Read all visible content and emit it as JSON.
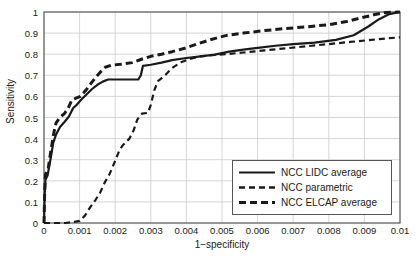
{
  "chart_data": {
    "type": "line",
    "title": "",
    "xlabel": "1−specificity",
    "ylabel": "Sensitivity",
    "xlim": [
      0,
      0.01
    ],
    "ylim": [
      0,
      1
    ],
    "xticks": [
      "0",
      "0.001",
      "0.002",
      "0.003",
      "0.004",
      "0.005",
      "0.006",
      "0.007",
      "0.008",
      "0.009",
      "0.01"
    ],
    "xtick_values": [
      0,
      0.001,
      0.002,
      0.003,
      0.004,
      0.005,
      0.006,
      0.007,
      0.008,
      0.009,
      0.01
    ],
    "yticks": [
      "0",
      "0.1",
      "0.2",
      "0.3",
      "0.4",
      "0.5",
      "0.6",
      "0.7",
      "0.8",
      "0.9",
      "1"
    ],
    "ytick_values": [
      0,
      0.1,
      0.2,
      0.3,
      0.4,
      0.5,
      0.6,
      0.7,
      0.8,
      0.9,
      1
    ],
    "grid": true,
    "legend_position": "lower right",
    "line_color": "#1a1a1a",
    "grid_color": "#cccccc",
    "series": [
      {
        "name": "NCC LIDC average",
        "style": "solid",
        "width": 2.2,
        "points": [
          [
            0.0,
            0.0
          ],
          [
            2e-05,
            0.135
          ],
          [
            4e-05,
            0.205
          ],
          [
            0.0001,
            0.225
          ],
          [
            0.00018,
            0.3
          ],
          [
            0.00026,
            0.38
          ],
          [
            0.00034,
            0.42
          ],
          [
            0.00045,
            0.455
          ],
          [
            0.00058,
            0.48
          ],
          [
            0.0007,
            0.505
          ],
          [
            0.00082,
            0.545
          ],
          [
            0.00092,
            0.56
          ],
          [
            0.00105,
            0.585
          ],
          [
            0.0012,
            0.61
          ],
          [
            0.00135,
            0.635
          ],
          [
            0.0015,
            0.655
          ],
          [
            0.00165,
            0.67
          ],
          [
            0.0018,
            0.68
          ],
          [
            0.00215,
            0.68
          ],
          [
            0.00265,
            0.68
          ],
          [
            0.00272,
            0.7
          ],
          [
            0.00278,
            0.745
          ],
          [
            0.003,
            0.75
          ],
          [
            0.0033,
            0.76
          ],
          [
            0.0036,
            0.772
          ],
          [
            0.004,
            0.782
          ],
          [
            0.0044,
            0.79
          ],
          [
            0.0048,
            0.798
          ],
          [
            0.0052,
            0.812
          ],
          [
            0.0056,
            0.822
          ],
          [
            0.006,
            0.83
          ],
          [
            0.0065,
            0.84
          ],
          [
            0.007,
            0.848
          ],
          [
            0.0076,
            0.855
          ],
          [
            0.0082,
            0.868
          ],
          [
            0.0087,
            0.89
          ],
          [
            0.0091,
            0.93
          ],
          [
            0.0094,
            0.965
          ],
          [
            0.0097,
            0.99
          ],
          [
            0.01,
            1.0
          ]
        ]
      },
      {
        "name": "NCC parametric",
        "style": "dashed",
        "width": 2.2,
        "points": [
          [
            0.0,
            0.0
          ],
          [
            0.0006,
            0.0
          ],
          [
            0.00085,
            0.005
          ],
          [
            0.001,
            0.01
          ],
          [
            0.00115,
            0.035
          ],
          [
            0.0013,
            0.075
          ],
          [
            0.00145,
            0.11
          ],
          [
            0.00158,
            0.145
          ],
          [
            0.0017,
            0.19
          ],
          [
            0.00185,
            0.235
          ],
          [
            0.002,
            0.295
          ],
          [
            0.00212,
            0.345
          ],
          [
            0.00222,
            0.37
          ],
          [
            0.0024,
            0.4
          ],
          [
            0.00252,
            0.44
          ],
          [
            0.00262,
            0.49
          ],
          [
            0.00275,
            0.518
          ],
          [
            0.00292,
            0.522
          ],
          [
            0.003,
            0.56
          ],
          [
            0.0031,
            0.63
          ],
          [
            0.0032,
            0.672
          ],
          [
            0.0034,
            0.7
          ],
          [
            0.0036,
            0.735
          ],
          [
            0.00385,
            0.762
          ],
          [
            0.0041,
            0.778
          ],
          [
            0.0044,
            0.79
          ],
          [
            0.0047,
            0.795
          ],
          [
            0.0051,
            0.8
          ],
          [
            0.0056,
            0.808
          ],
          [
            0.0062,
            0.818
          ],
          [
            0.0068,
            0.828
          ],
          [
            0.0074,
            0.838
          ],
          [
            0.008,
            0.848
          ],
          [
            0.0086,
            0.858
          ],
          [
            0.0092,
            0.868
          ],
          [
            0.0097,
            0.876
          ],
          [
            0.01,
            0.88
          ]
        ]
      },
      {
        "name": "NCC ELCAP average",
        "style": "dashed",
        "width": 3.0,
        "points": [
          [
            0.0,
            0.0
          ],
          [
            2e-05,
            0.15
          ],
          [
            4e-05,
            0.23
          ],
          [
            0.00012,
            0.26
          ],
          [
            0.0002,
            0.35
          ],
          [
            0.00028,
            0.43
          ],
          [
            0.00034,
            0.475
          ],
          [
            0.00045,
            0.5
          ],
          [
            0.00058,
            0.52
          ],
          [
            0.00068,
            0.545
          ],
          [
            0.00078,
            0.582
          ],
          [
            0.0009,
            0.592
          ],
          [
            0.00102,
            0.6
          ],
          [
            0.00118,
            0.63
          ],
          [
            0.00132,
            0.662
          ],
          [
            0.00145,
            0.69
          ],
          [
            0.00158,
            0.715
          ],
          [
            0.00172,
            0.738
          ],
          [
            0.0019,
            0.748
          ],
          [
            0.00215,
            0.752
          ],
          [
            0.00248,
            0.76
          ],
          [
            0.00272,
            0.775
          ],
          [
            0.003,
            0.79
          ],
          [
            0.0033,
            0.8
          ],
          [
            0.0036,
            0.812
          ],
          [
            0.00395,
            0.828
          ],
          [
            0.0043,
            0.848
          ],
          [
            0.0047,
            0.87
          ],
          [
            0.0051,
            0.888
          ],
          [
            0.0056,
            0.9
          ],
          [
            0.0062,
            0.912
          ],
          [
            0.0068,
            0.922
          ],
          [
            0.0074,
            0.93
          ],
          [
            0.008,
            0.94
          ],
          [
            0.0085,
            0.955
          ],
          [
            0.0089,
            0.972
          ],
          [
            0.0093,
            0.988
          ],
          [
            0.0096,
            0.998
          ],
          [
            0.01,
            1.0
          ]
        ]
      }
    ]
  },
  "legend": {
    "items": [
      {
        "label": "NCC LIDC average",
        "style": "solid"
      },
      {
        "label": "NCC parametric",
        "style": "dashed-thin"
      },
      {
        "label": "NCC ELCAP average",
        "style": "dashed-thick"
      }
    ]
  }
}
